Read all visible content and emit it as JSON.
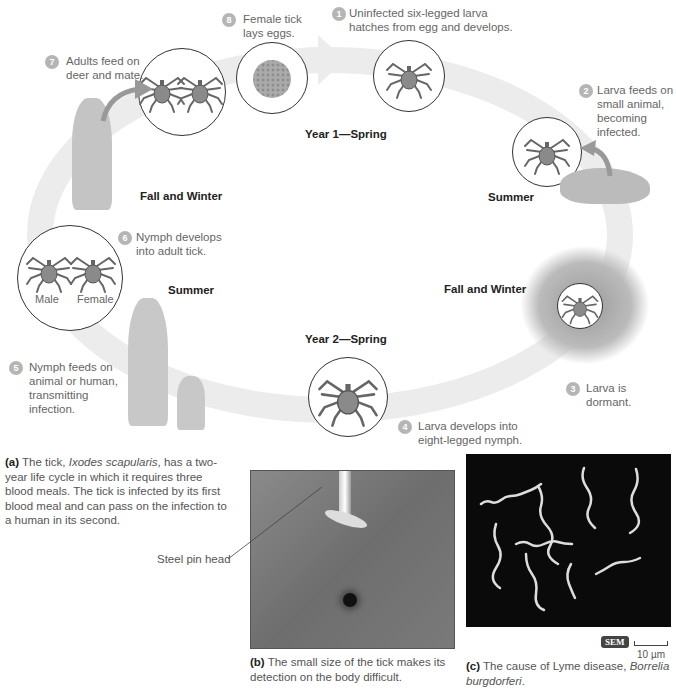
{
  "cycle": {
    "seasons": {
      "year1_spring": "Year 1—Spring",
      "summer_right": "Summer",
      "fall_winter_right": "Fall and Winter",
      "year2_spring": "Year 2—Spring",
      "summer_left": "Summer",
      "fall_winter_left": "Fall and Winter"
    },
    "steps": [
      {
        "num": "1",
        "text": "Uninfected six-legged larva hatches from egg and develops."
      },
      {
        "num": "2",
        "text": "Larva feeds on small animal, becoming infected."
      },
      {
        "num": "3",
        "text": "Larva is dormant."
      },
      {
        "num": "4",
        "text": "Larva develops into eight-legged nymph."
      },
      {
        "num": "5",
        "text": "Nymph feeds on animal or human, transmitting infection."
      },
      {
        "num": "6",
        "text": "Nymph develops into adult tick."
      },
      {
        "num": "7",
        "text": "Adults feed on deer and mate."
      },
      {
        "num": "8",
        "text": "Female tick lays eggs."
      }
    ],
    "adult_labels": {
      "male": "Male",
      "female": "Female"
    }
  },
  "panels": {
    "a": {
      "label": "(a)",
      "text_pre": " The tick, ",
      "species": "Ixodes scapularis",
      "text_post": ", has a two-year life cycle in which it requires three blood meals. The tick is infected by its first blood meal and can pass on the infection to a human in its second."
    },
    "b": {
      "label": "(b)",
      "text": " The small size of the tick makes its detection on the body difficult.",
      "callout": "Steel pin head"
    },
    "c": {
      "label": "(c)",
      "text": " The cause of Lyme disease, ",
      "species": "Borrelia burgdorferi",
      "text_end": ".",
      "badge": "SEM",
      "scale": "10 µm"
    }
  },
  "colors": {
    "arrow_band": "#e8e8e8",
    "badge": "#b5b5b5",
    "sem_badge": "#444444",
    "tick_body": "#8a8a8a"
  }
}
